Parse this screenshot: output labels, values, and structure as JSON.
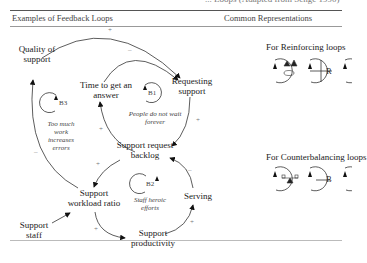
{
  "caption_cut": "... Loops (Adapted from Senge 1990)",
  "headers": {
    "left": "Examples of Feedback Loops",
    "right": "Common Representations"
  },
  "nodes": {
    "quality": "Quality of support",
    "time": "Time to get an answer",
    "requesting": "Requesting support",
    "backlog": "Support request backlog",
    "workload": "Support workload ratio",
    "staff": "Support staff",
    "productivity": "Support productivity",
    "serving": "Serving"
  },
  "loops": {
    "b1": {
      "label": "B1",
      "note": "People do not wait forever"
    },
    "b2": {
      "label": "B2",
      "note": "Staff heroic efforts"
    },
    "b3": {
      "label": "B3",
      "note": "Too much work increases errors"
    }
  },
  "signs": {
    "quality_to_requesting": "+",
    "time_to_requesting": "–",
    "requesting_to_backlog": "+",
    "backlog_to_time": "+",
    "workload_to_quality": "–",
    "backlog_to_workload": "+",
    "workload_to_productivity": "+",
    "productivity_to_serving": "+",
    "serving_to_backlog": "–"
  },
  "representations": {
    "reinforcing": {
      "title": "For Reinforcing loops",
      "symbols": [
        "snowball-icon",
        "+",
        "R"
      ]
    },
    "balancing": {
      "title": "For Counterbalancing loops",
      "symbols": [
        "seesaw-icon",
        "—",
        "B"
      ]
    }
  }
}
